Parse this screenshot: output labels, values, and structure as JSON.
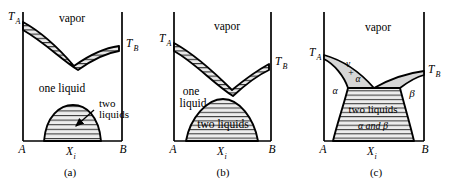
{
  "figure": {
    "background_color": "#ffffff",
    "line_color": "#000000",
    "hatch_color": "#000000",
    "fill_shade": "#d9d9d9"
  },
  "panels": [
    {
      "id": "a",
      "caption": "(a)",
      "axis_left_label": "A",
      "axis_right_label": "B",
      "axis_center_label": "X",
      "axis_center_sub": "i",
      "temp_left_label": "T",
      "temp_left_sub": "A",
      "temp_right_label": "T",
      "temp_right_sub": "B",
      "regions": [
        {
          "name": "vapor-region",
          "label": "vapor"
        },
        {
          "name": "one-liquid-region",
          "label": "one liquid"
        },
        {
          "name": "two-liquids-region",
          "label_line1": "two",
          "label_line2": "liquids"
        }
      ],
      "has_annotation_arrow": true
    },
    {
      "id": "b",
      "caption": "(b)",
      "axis_left_label": "A",
      "axis_right_label": "B",
      "axis_center_label": "X",
      "axis_center_sub": "i",
      "temp_left_label": "T",
      "temp_left_sub": "A",
      "temp_right_label": "T",
      "temp_right_sub": "B",
      "regions": [
        {
          "name": "vapor-region",
          "label": "vapor"
        },
        {
          "name": "one-liquid-region",
          "label_line1": "one",
          "label_line2": "liquid"
        },
        {
          "name": "two-liquids-region",
          "label": "two liquids"
        }
      ],
      "has_annotation_arrow": false
    },
    {
      "id": "c",
      "caption": "(c)",
      "axis_left_label": "A",
      "axis_right_label": "B",
      "axis_center_label": "X",
      "axis_center_sub": "i",
      "temp_left_label": "T",
      "temp_left_sub": "A",
      "temp_right_label": "T",
      "temp_right_sub": "B",
      "regions": [
        {
          "name": "vapor-region",
          "label": "vapor"
        },
        {
          "name": "vapor-plus-alpha-region",
          "label_line1": "v",
          "label_line2": "+",
          "label_line3": "α"
        },
        {
          "name": "alpha-region",
          "label": "α"
        },
        {
          "name": "beta-region",
          "label": "β"
        },
        {
          "name": "two-liquids-region",
          "label_line1": "two liquids",
          "label_line2": "α and β"
        }
      ],
      "has_annotation_arrow": false
    }
  ]
}
